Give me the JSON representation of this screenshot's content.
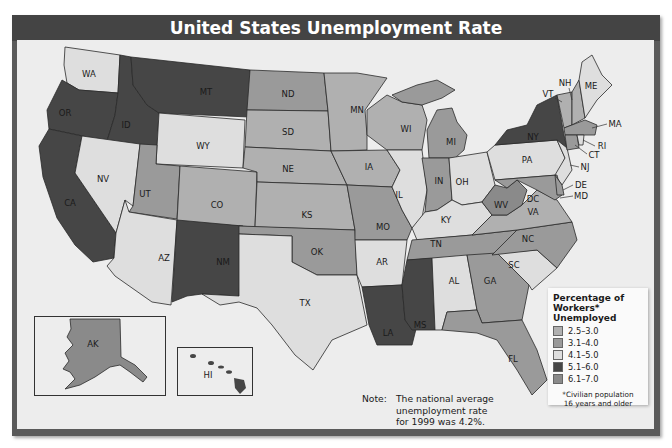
{
  "title": "United States Unemployment Rate",
  "legend": {
    "title": "Percentage of Workers* Unemployed",
    "title_lines": [
      "Percentage of",
      "Workers*",
      "Unemployed"
    ],
    "items": [
      {
        "range": "2.5–3.0",
        "color": "#b0b0b0"
      },
      {
        "range": "3.1–4.0",
        "color": "#9a9a9a"
      },
      {
        "range": "4.1–5.0",
        "color": "#dedede"
      },
      {
        "range": "5.1–6.0",
        "color": "#464646"
      },
      {
        "range": "6.1–7.0",
        "color": "#8a8a8a"
      }
    ],
    "footnote_lines": [
      "*Civilian population",
      "16 years and older"
    ]
  },
  "note": {
    "label": "Note:",
    "lines": [
      "The national average",
      "unemployment rate",
      "for 1999 was 4.2%."
    ]
  },
  "source": {
    "label": "Source: ",
    "title": "Statistical Abstract of the United States: 2000"
  },
  "states": {
    "WA": "4.1–5.0",
    "OR": "5.1–6.0",
    "CA": "5.1–6.0",
    "ID": "5.1–6.0",
    "MT": "5.1–6.0",
    "NV": "4.1–5.0",
    "WY": "4.1–5.0",
    "UT": "3.1–4.0",
    "CO": "2.5–3.0",
    "AZ": "4.1–5.0",
    "NM": "5.1–6.0",
    "ND": "3.1–4.0",
    "SD": "2.5–3.0",
    "NE": "2.5–3.0",
    "KS": "2.5–3.0",
    "OK": "3.1–4.0",
    "TX": "4.1–5.0",
    "MN": "2.5–3.0",
    "IA": "2.5–3.0",
    "MO": "3.1–4.0",
    "AR": "4.1–5.0",
    "LA": "5.1–6.0",
    "WI": "2.5–3.0",
    "IL": "4.1–5.0",
    "MI": "3.1–4.0",
    "IN": "3.1–4.0",
    "OH": "4.1–5.0",
    "KY": "4.1–5.0",
    "TN": "3.1–4.0",
    "MS": "5.1–6.0",
    "AL": "4.1–5.0",
    "GA": "3.1–4.0",
    "FL": "3.1–4.0",
    "SC": "4.1–5.0",
    "NC": "3.1–4.0",
    "VA": "2.5–3.0",
    "WV": "6.1–7.0",
    "PA": "4.1–5.0",
    "NY": "5.1–6.0",
    "NJ": "4.1–5.0",
    "DE": "3.1–4.0",
    "MD": "3.1–4.0",
    "DC": "6.1–7.0",
    "VT": "2.5–3.0",
    "NH": "2.5–3.0",
    "ME": "4.1–5.0",
    "MA": "3.1–4.0",
    "RI": "4.1–5.0",
    "CT": "3.1–4.0",
    "AK": "6.1–7.0",
    "HI": "5.1–6.0"
  },
  "labels": {
    "WA": "WA",
    "OR": "OR",
    "CA": "CA",
    "ID": "ID",
    "MT": "MT",
    "NV": "NV",
    "WY": "WY",
    "UT": "UT",
    "CO": "CO",
    "AZ": "AZ",
    "NM": "NM",
    "ND": "ND",
    "SD": "SD",
    "NE": "NE",
    "KS": "KS",
    "OK": "OK",
    "TX": "TX",
    "MN": "MN",
    "IA": "IA",
    "MO": "MO",
    "AR": "AR",
    "LA": "LA",
    "WI": "WI",
    "IL": "IL",
    "MI": "MI",
    "IN": "IN",
    "OH": "OH",
    "KY": "KY",
    "TN": "TN",
    "MS": "MS",
    "AL": "AL",
    "GA": "GA",
    "FL": "FL",
    "SC": "SC",
    "NC": "NC",
    "VA": "VA",
    "WV": "WV",
    "PA": "PA",
    "NY": "NY",
    "NJ": "NJ",
    "DE": "DE",
    "MD": "MD",
    "DC": "DC",
    "VT": "VT",
    "NH": "NH",
    "ME": "ME",
    "MA": "MA",
    "RI": "RI",
    "CT": "CT",
    "AK": "AK",
    "HI": "HI"
  }
}
